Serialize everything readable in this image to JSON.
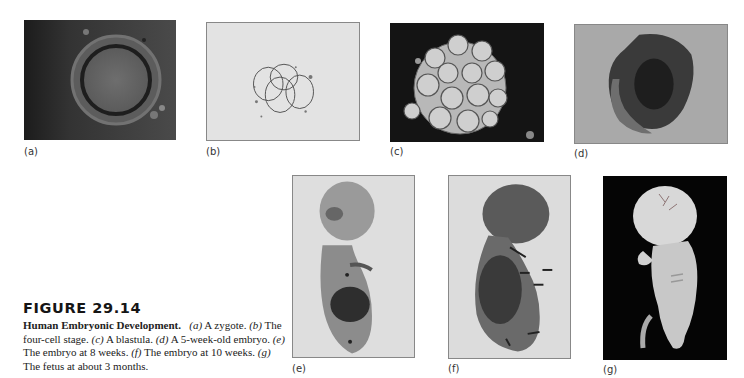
{
  "figure": {
    "number": "FIGURE 29.14",
    "caption_title": "Human Embryonic Development.",
    "caption_parts": [
      {
        "tag": "(a)",
        "text": "A zygote."
      },
      {
        "tag": "(b)",
        "text": "The four-cell stage."
      },
      {
        "tag": "(c)",
        "text": "A blastula."
      },
      {
        "tag": "(d)",
        "text": "A 5-week-old embryo."
      },
      {
        "tag": "(e)",
        "text": "The embryo at 8 weeks."
      },
      {
        "tag": "(f)",
        "text": "The embryo at 10 weeks."
      },
      {
        "tag": "(g)",
        "text": "The fetus at about 3 months."
      }
    ]
  },
  "panels": [
    {
      "id": "a",
      "label": "(a)",
      "subject": "zygote",
      "background": "#3a3a3a"
    },
    {
      "id": "b",
      "label": "(b)",
      "subject": "four-cell stage",
      "background": "#e2e2e2"
    },
    {
      "id": "c",
      "label": "(c)",
      "subject": "blastula",
      "background": "#141414"
    },
    {
      "id": "d",
      "label": "(d)",
      "subject": "5-week-old embryo",
      "background": "#a8a8a8"
    },
    {
      "id": "e",
      "label": "(e)",
      "subject": "embryo at 8 weeks",
      "background": "#dcdcdc"
    },
    {
      "id": "f",
      "label": "(f)",
      "subject": "embryo at 10 weeks",
      "background": "#dadada"
    },
    {
      "id": "g",
      "label": "(g)",
      "subject": "fetus at about 3 months",
      "background": "#050505"
    }
  ]
}
